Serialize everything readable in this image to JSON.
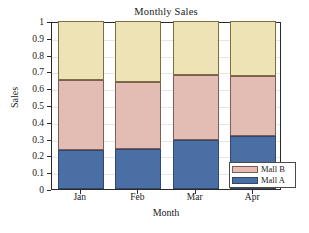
{
  "chart_data": {
    "type": "bar",
    "subtype": "stacked-bar",
    "title": "Monthly Sales",
    "xlabel": "Month",
    "ylabel": "Sales",
    "categories": [
      "Jan",
      "Feb",
      "Mar",
      "Apr"
    ],
    "series": [
      {
        "name": "Mall A",
        "color": "#4A6FA5",
        "values": [
          0.23,
          0.24,
          0.29,
          0.315
        ]
      },
      {
        "name": "Mall B",
        "color": "#E3BDB4",
        "values": [
          0.42,
          0.395,
          0.39,
          0.355
        ]
      },
      {
        "name": "",
        "color": "#EDE3B4",
        "values": [
          0.35,
          0.365,
          0.32,
          0.33
        ]
      }
    ],
    "cumulative_tops": {
      "mall_a": [
        0.23,
        0.24,
        0.29,
        0.315
      ],
      "mall_b": [
        0.65,
        0.635,
        0.68,
        0.67
      ],
      "total": [
        1.0,
        1.0,
        1.0,
        1.0
      ]
    },
    "ylim": [
      0,
      1
    ],
    "ytick_labels": [
      "0",
      "0.1",
      "0.2",
      "0.3",
      "0.4",
      "0.5",
      "0.6",
      "0.7",
      "0.8",
      "0.9",
      "1"
    ],
    "ytick_values": [
      0,
      0.1,
      0.2,
      0.3,
      0.4,
      0.5,
      0.6,
      0.7,
      0.8,
      0.9,
      1
    ],
    "grid": true,
    "legend_position": "bottom-right",
    "legend_entries": [
      {
        "label": "Mall B",
        "color": "#E3BDB4"
      },
      {
        "label": "Mall A",
        "color": "#4A6FA5"
      }
    ]
  },
  "colors": {
    "mall_a": "#4A6FA5",
    "mall_b": "#E3BDB4",
    "remainder": "#EDE3B4",
    "axis": "#2a2a2a",
    "grid": "#e6e6e6",
    "background": "#ffffff"
  }
}
